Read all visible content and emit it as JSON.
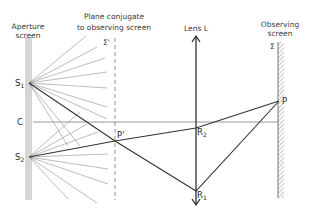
{
  "labels": {
    "aperture_screen_line1": "Aperture",
    "aperture_screen_line2": "screen",
    "conjugate_plane_line1": "Plane conjugate",
    "conjugate_plane_line2": "to observing screen",
    "sigma_prime": "Σ'",
    "lens": "Lens L",
    "observing_screen_line1": "Observing",
    "observing_screen_line2": "screen",
    "sigma": "Σ",
    "s1": "S",
    "s1_sub": "1",
    "s2": "S",
    "s2_sub": "2",
    "c": "C",
    "p_prime": "P'",
    "p": "P",
    "r1": "R",
    "r1_sub": "1",
    "r2": "R",
    "r2_sub": "2"
  },
  "colors": {
    "aperture_screen": "#d4d4d4",
    "rays": "#8a8a8a",
    "heavy_rays": "#333333",
    "axis": "#666666",
    "lens": "#222222",
    "hatch": "#9a9a9a"
  }
}
